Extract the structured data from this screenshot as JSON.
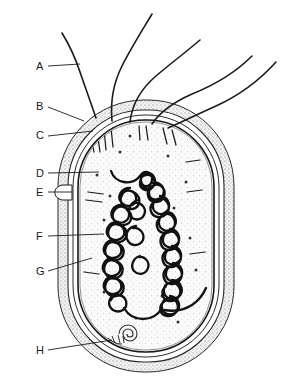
{
  "figure": {
    "background_color": "#ffffff",
    "ink_color": "#1a1a1a",
    "capsule_fill": "#efefef",
    "cytoplasm_fill": "#f7f7f7",
    "stipple_color": "#6b6b6b"
  },
  "labels": [
    {
      "id": "A",
      "text": "A",
      "x": 36,
      "y": 70,
      "leader_from_x": 48,
      "leader_from_y": 66,
      "leader_to_x": 80,
      "leader_to_y": 64
    },
    {
      "id": "B",
      "text": "B",
      "x": 36,
      "y": 110,
      "leader_from_x": 48,
      "leader_from_y": 107,
      "leader_to_x": 84,
      "leader_to_y": 121
    },
    {
      "id": "C",
      "text": "C",
      "x": 36,
      "y": 139,
      "leader_from_x": 48,
      "leader_from_y": 136,
      "leader_to_x": 93,
      "leader_to_y": 131
    },
    {
      "id": "D",
      "text": "D",
      "x": 36,
      "y": 177,
      "leader_from_x": 48,
      "leader_from_y": 173,
      "leader_to_x": 99,
      "leader_to_y": 172
    },
    {
      "id": "E",
      "text": "E",
      "x": 36,
      "y": 196,
      "leader_from_x": 48,
      "leader_from_y": 192,
      "leader_to_x": 72,
      "leader_to_y": 192
    },
    {
      "id": "F",
      "text": "F",
      "x": 36,
      "y": 240,
      "leader_from_x": 48,
      "leader_from_y": 236,
      "leader_to_x": 104,
      "leader_to_y": 234
    },
    {
      "id": "G",
      "text": "G",
      "x": 36,
      "y": 275,
      "leader_from_x": 48,
      "leader_from_y": 271,
      "leader_to_x": 92,
      "leader_to_y": 258
    },
    {
      "id": "H",
      "text": "H",
      "x": 36,
      "y": 354,
      "leader_from_x": 48,
      "leader_from_y": 350,
      "leader_to_x": 112,
      "leader_to_y": 340
    }
  ],
  "structures": {
    "capsule": {
      "name": "capsule-outer-layer",
      "x": 58,
      "y": 100,
      "width": 176,
      "height": 272,
      "radius": 86
    },
    "cell_wall": {
      "name": "cell-wall",
      "x": 68,
      "y": 110,
      "width": 156,
      "height": 252,
      "radius": 76
    },
    "plasma_membrane": {
      "name": "plasma-membrane",
      "x": 75,
      "y": 117,
      "width": 142,
      "height": 238,
      "radius": 70
    },
    "cytoplasm": {
      "name": "cytoplasm",
      "x": 80,
      "y": 122,
      "width": 132,
      "height": 228,
      "radius": 64
    },
    "nucleoid": {
      "name": "nucleoid-dna-strand",
      "center_x": 146,
      "center_y": 245
    },
    "plasmid": {
      "name": "plasmid-spiral",
      "center_x": 128,
      "center_y": 334,
      "radius": 9
    },
    "flagella_count": 5,
    "pili_count": 14,
    "ribosome_count": 16
  },
  "flagella": [
    {
      "id": "flagellum-1",
      "path": "M 96 118 C 90 100 84 84 80 72 C 76 60 70 46 62 33"
    },
    {
      "id": "flagellum-2",
      "path": "M 112 121 C 110 100 114 82 122 66 C 130 50 140 34 152 14"
    },
    {
      "id": "flagellum-3",
      "path": "M 130 122 C 132 104 142 88 156 76 C 170 64 186 52 200 40"
    },
    {
      "id": "flagellum-4",
      "path": "M 152 124 C 160 112 174 102 192 94 C 212 86 234 74 252 56"
    },
    {
      "id": "flagellum-5",
      "path": "M 168 128 C 182 122 198 114 216 106 C 238 96 258 82 276 62"
    }
  ],
  "pili": [
    {
      "x1": 90,
      "y1": 132,
      "x2": 94,
      "y2": 152
    },
    {
      "x1": 97,
      "y1": 130,
      "x2": 100,
      "y2": 152
    },
    {
      "x1": 104,
      "y1": 129,
      "x2": 106,
      "y2": 150
    },
    {
      "x1": 111,
      "y1": 128,
      "x2": 113,
      "y2": 147
    },
    {
      "x1": 139,
      "y1": 126,
      "x2": 140,
      "y2": 140
    },
    {
      "x1": 146,
      "y1": 126,
      "x2": 148,
      "y2": 140
    },
    {
      "x1": 163,
      "y1": 128,
      "x2": 167,
      "y2": 144
    },
    {
      "x1": 172,
      "y1": 130,
      "x2": 176,
      "y2": 145
    },
    {
      "x1": 200,
      "y1": 160,
      "x2": 186,
      "y2": 162
    },
    {
      "x1": 202,
      "y1": 190,
      "x2": 187,
      "y2": 192
    },
    {
      "x1": 205,
      "y1": 252,
      "x2": 190,
      "y2": 254
    },
    {
      "x1": 88,
      "y1": 192,
      "x2": 103,
      "y2": 194
    },
    {
      "x1": 86,
      "y1": 200,
      "x2": 102,
      "y2": 202
    },
    {
      "x1": 84,
      "y1": 272,
      "x2": 99,
      "y2": 274
    }
  ],
  "ribosomes": [
    {
      "x": 120,
      "y": 152
    },
    {
      "x": 168,
      "y": 156
    },
    {
      "x": 97,
      "y": 175
    },
    {
      "x": 186,
      "y": 182
    },
    {
      "x": 104,
      "y": 220
    },
    {
      "x": 174,
      "y": 208
    },
    {
      "x": 117,
      "y": 262
    },
    {
      "x": 190,
      "y": 238
    },
    {
      "x": 104,
      "y": 292
    },
    {
      "x": 162,
      "y": 296
    },
    {
      "x": 136,
      "y": 318
    },
    {
      "x": 178,
      "y": 322
    },
    {
      "x": 150,
      "y": 186
    },
    {
      "x": 110,
      "y": 196
    },
    {
      "x": 196,
      "y": 270
    },
    {
      "x": 130,
      "y": 136
    }
  ]
}
